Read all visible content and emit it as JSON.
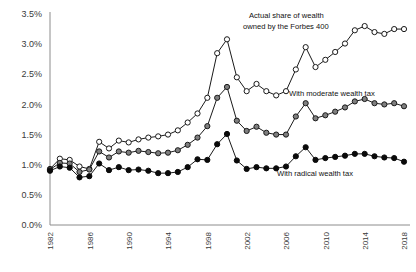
{
  "chart_data": {
    "type": "line",
    "title": "",
    "subtitle": "",
    "xlabel": "",
    "ylabel": "",
    "grid": false,
    "legend_position": "inline-annotations",
    "ylim": [
      0.0,
      3.5
    ],
    "ytick_values": [
      0.0,
      0.5,
      1.0,
      1.5,
      2.0,
      2.5,
      3.0,
      3.5
    ],
    "ytick_labels": [
      "0.0%",
      "0.5%",
      "1.0%",
      "1.5%",
      "2.0%",
      "2.5%",
      "3.0%",
      "3.5%"
    ],
    "xlim": [
      1982,
      2018
    ],
    "x": [
      1982,
      1983,
      1984,
      1985,
      1986,
      1987,
      1988,
      1989,
      1990,
      1991,
      1992,
      1993,
      1994,
      1995,
      1996,
      1997,
      1998,
      1999,
      2000,
      2001,
      2002,
      2003,
      2004,
      2005,
      2006,
      2007,
      2008,
      2009,
      2010,
      2011,
      2012,
      2013,
      2014,
      2015,
      2016,
      2017,
      2018
    ],
    "xtick_values": [
      1982,
      1986,
      1990,
      1994,
      1998,
      2002,
      2006,
      2010,
      2014,
      2018
    ],
    "xtick_labels": [
      "1982",
      "1986",
      "1990",
      "1994",
      "1998",
      "2002",
      "2006",
      "2010",
      "2014",
      "2018"
    ],
    "xtick_rotation": 90,
    "series": [
      {
        "name": "Actual share of wealth owned by the Forbes 400",
        "marker": "open-circle",
        "color": "#ffffff",
        "stroke": "#1a1a1a",
        "values": [
          0.93,
          1.1,
          1.08,
          0.97,
          0.93,
          1.38,
          1.27,
          1.4,
          1.37,
          1.42,
          1.45,
          1.47,
          1.5,
          1.57,
          1.7,
          1.85,
          2.11,
          2.85,
          3.08,
          2.45,
          2.22,
          2.34,
          2.22,
          2.15,
          2.22,
          2.58,
          2.95,
          2.62,
          2.74,
          2.87,
          3.01,
          3.23,
          3.3,
          3.2,
          3.17,
          3.25,
          3.25
        ]
      },
      {
        "name": "With moderate wealth tax",
        "marker": "gray-circle",
        "color": "#7f7f7f",
        "stroke": "#1a1a1a",
        "values": [
          0.92,
          1.03,
          1.02,
          0.88,
          0.92,
          1.22,
          1.12,
          1.22,
          1.2,
          1.23,
          1.21,
          1.19,
          1.2,
          1.24,
          1.33,
          1.45,
          1.64,
          2.11,
          2.29,
          1.73,
          1.56,
          1.63,
          1.53,
          1.5,
          1.5,
          1.8,
          2.02,
          1.77,
          1.82,
          1.88,
          1.95,
          2.05,
          2.09,
          2.02,
          2.0,
          2.02,
          1.97
        ]
      },
      {
        "name": "With radical wealth tax",
        "marker": "black-circle",
        "color": "#0a0a0a",
        "stroke": "#0a0a0a",
        "values": [
          0.9,
          0.97,
          0.95,
          0.79,
          0.81,
          1.02,
          0.91,
          0.96,
          0.91,
          0.92,
          0.9,
          0.86,
          0.86,
          0.88,
          0.96,
          1.09,
          1.08,
          1.34,
          1.51,
          1.07,
          0.93,
          0.96,
          0.94,
          0.94,
          0.97,
          1.14,
          1.29,
          1.08,
          1.11,
          1.13,
          1.15,
          1.18,
          1.18,
          1.14,
          1.12,
          1.11,
          1.05
        ]
      }
    ],
    "annotations": [
      {
        "text": "Actual share of wealth",
        "x_px": 249,
        "y_px": 18
      },
      {
        "text": "owned by the Forbes 400",
        "x_px": 243,
        "y_px": 29
      },
      {
        "text": "With moderate wealth tax",
        "x_px": 289,
        "y_px": 96
      },
      {
        "text": "With radical wealth tax",
        "x_px": 277,
        "y_px": 176
      }
    ]
  }
}
